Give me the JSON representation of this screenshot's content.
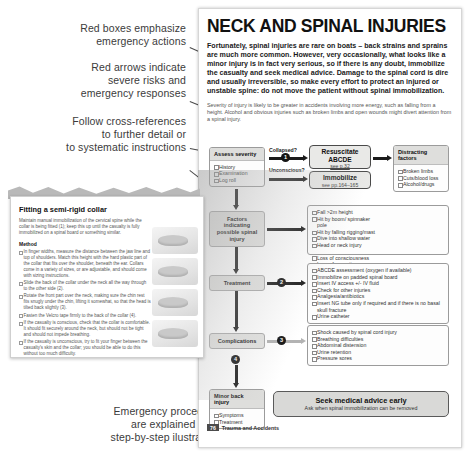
{
  "annotations": [
    {
      "id": "a1",
      "text": "Red boxes emphasize\nemergency actions"
    },
    {
      "id": "a2",
      "text": "Red arrows indicate\nsevere risks and\nemergency responses"
    },
    {
      "id": "a3",
      "text": "Follow cross-references\nto further detail or\nto systematic instructions"
    },
    {
      "id": "a4",
      "text": "Emergency procedures\nare explained using\nstep-by-step ilustrations"
    }
  ],
  "page": {
    "title": "NECK AND SPINAL INJURIES",
    "intro": "Fortunately, spinal injuries are rare on boats – back strains and sprains are much more common. However, very occasionally, what looks like a minor injury is in fact very serious, so if there is any doubt, immobilize the casualty and seek medical advice. Damage to the spinal cord is dire and usually irreversible, so make every effort to protect an injured or unstable spine: do not move the patient without spinal immobilization.",
    "subintro": "Severity of injury is likely to be greater in accidents involving more energy, such as falling from a height. Alcohol and obvious injuries such as broken limbs and open wounds might divert attention from a spinal injury.",
    "footer_page": "76",
    "footer_section": "Trauma and Accidents"
  },
  "flow": {
    "assess": {
      "header": "Assess severity",
      "items": [
        "History",
        "Examination",
        "Log roll"
      ]
    },
    "questions": {
      "collapsed": "Collapsed?",
      "unconscious": "Unconscious?"
    },
    "resuscitate": {
      "title": "Resuscitate\nABCDE",
      "ref": "see p.32"
    },
    "immobilize": {
      "title": "Immobilize",
      "ref": "see pp.164–165"
    },
    "distracting": {
      "header": "Distracting factors",
      "items": [
        "Broken limbs",
        "Cuts/blood loss",
        "Alcohol/drugs"
      ]
    },
    "factors_stage": "Factors\nindicating\npossible spinal\ninjury",
    "factors_left": {
      "items": [
        "Fall >2m height",
        "Hit by boom/ spinnaker pole",
        "Hit by falling rigging/mast",
        "Dive into shallow water",
        "Head or neck injury"
      ]
    },
    "factors_right": {
      "items": [
        "Loss of consciousness",
        "Loss of sensation or movement",
        "Casualty complains of back pain following an accident"
      ]
    },
    "treatment_stage": "Treatment",
    "treatment": {
      "items": [
        "ABCDE assessment (oxygen if available)",
        "Immobilize on padded spinal board",
        "Insert IV access +/- IV fluid",
        "Check for other injuries",
        "Analgesia/antibiotics",
        "Insert NG tube only if required and if there is no basal skull fracture",
        "Urine catheter"
      ]
    },
    "complications_stage": "Complications",
    "complications": {
      "items": [
        "Shock caused by spinal cord injury",
        "Breathing difficulties",
        "Abdominal distension",
        "Urine retention",
        "Pressure sores"
      ]
    },
    "minor": {
      "header": "Minor back injury",
      "items": [
        "Symptoms",
        "Treatment"
      ]
    },
    "banner": {
      "title": "Seek medical advice early",
      "subtitle": "Ask when spinal immobilization can be removed"
    },
    "steps": [
      "1",
      "2",
      "3",
      "4"
    ]
  },
  "inset": {
    "title": "Fitting a semi-rigid collar",
    "lead": "Maintain manual immobilization of the cervical spine while the collar is being fitted (1); keep this up until the casualty is fully immobilized on a spinal board or something similar.",
    "method_label": "Method",
    "steps": [
      "In finger widths, measure the distance between the jaw line and top of shoulders. Match this height with the hard plastic part of the collar that fits over the shoulder, beneath the ear. Collars come in a variety of sizes, or are adjustable, and should come with sizing instructions.",
      "Slide the back of the collar under the neck all the way through to the other side (2).",
      "Rotate the front part over the neck, making sure the chin rest fits snugly under the chin, lifting it somewhat, so that the head is tilted back slightly (3).",
      "Fasten the Velcro tape firmly to the back of the collar (4).",
      "If the casualty is conscious, check that the collar is comfortable. It should fit securely around the neck, but should not be tight and should not impede breathing.",
      "If the casualty is unconscious, try to fit your finger between the casualty's skin and the collar; you should be able to do this without too much difficulty."
    ]
  },
  "colors": {
    "accent": "#4a4a4a",
    "panel": "#dededc",
    "stage": "#e3e3e1"
  }
}
